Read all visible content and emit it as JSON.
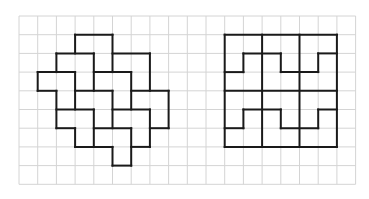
{
  "diagram": {
    "grid": {
      "origin_x": 19,
      "origin_y": 16,
      "cell": 18.7,
      "cols": 18,
      "rows": 9,
      "line_color": "#d4d4d4"
    },
    "stroke_color": "#1a1a1a",
    "figures": [
      {
        "name": "left-tessellation",
        "segments": [
          [
            3,
            1,
            5,
            1
          ],
          [
            3,
            1,
            3,
            2
          ],
          [
            5,
            1,
            5,
            3
          ],
          [
            2,
            2,
            4,
            2
          ],
          [
            5,
            2,
            7,
            2
          ],
          [
            7,
            2,
            7,
            4
          ],
          [
            2,
            2,
            2,
            3
          ],
          [
            1,
            3,
            3,
            3
          ],
          [
            1,
            3,
            1,
            4
          ],
          [
            1,
            4,
            2,
            4
          ],
          [
            2,
            4,
            2,
            6
          ],
          [
            4,
            2,
            4,
            4
          ],
          [
            3,
            3,
            3,
            5
          ],
          [
            3,
            6,
            3,
            7
          ],
          [
            4,
            3,
            6,
            3
          ],
          [
            6,
            3,
            6,
            5
          ],
          [
            3,
            4,
            5,
            4
          ],
          [
            6,
            4,
            8,
            4
          ],
          [
            8,
            4,
            8,
            6
          ],
          [
            7,
            6,
            8,
            6
          ],
          [
            7,
            5,
            7,
            7
          ],
          [
            5,
            4,
            5,
            6
          ],
          [
            2,
            5,
            4,
            5
          ],
          [
            4,
            5,
            4,
            7
          ],
          [
            5,
            5,
            7,
            5
          ],
          [
            2,
            6,
            3,
            6
          ],
          [
            3,
            7,
            5,
            7
          ],
          [
            4,
            6,
            6,
            6
          ],
          [
            6,
            6,
            6,
            8
          ],
          [
            5,
            7,
            5,
            8
          ],
          [
            5,
            8,
            6,
            8
          ],
          [
            6,
            7,
            7,
            7
          ]
        ]
      },
      {
        "name": "right-tessellation",
        "segments": [
          [
            11,
            1,
            17,
            1
          ],
          [
            11,
            7,
            17,
            7
          ],
          [
            11,
            1,
            11,
            7
          ],
          [
            17,
            1,
            17,
            7
          ],
          [
            13,
            1,
            13,
            7
          ],
          [
            15,
            1,
            15,
            7
          ],
          [
            11,
            4,
            17,
            4
          ],
          [
            11,
            3,
            12,
            3
          ],
          [
            12,
            2,
            12,
            3
          ],
          [
            12,
            2,
            14,
            2
          ],
          [
            14,
            2,
            14,
            3
          ],
          [
            14,
            3,
            16,
            3
          ],
          [
            16,
            2,
            16,
            3
          ],
          [
            16,
            2,
            17,
            2
          ],
          [
            11,
            6,
            12,
            6
          ],
          [
            12,
            5,
            12,
            6
          ],
          [
            12,
            5,
            14,
            5
          ],
          [
            14,
            5,
            14,
            6
          ],
          [
            14,
            6,
            16,
            6
          ],
          [
            16,
            5,
            16,
            6
          ],
          [
            16,
            5,
            17,
            5
          ]
        ]
      }
    ]
  }
}
